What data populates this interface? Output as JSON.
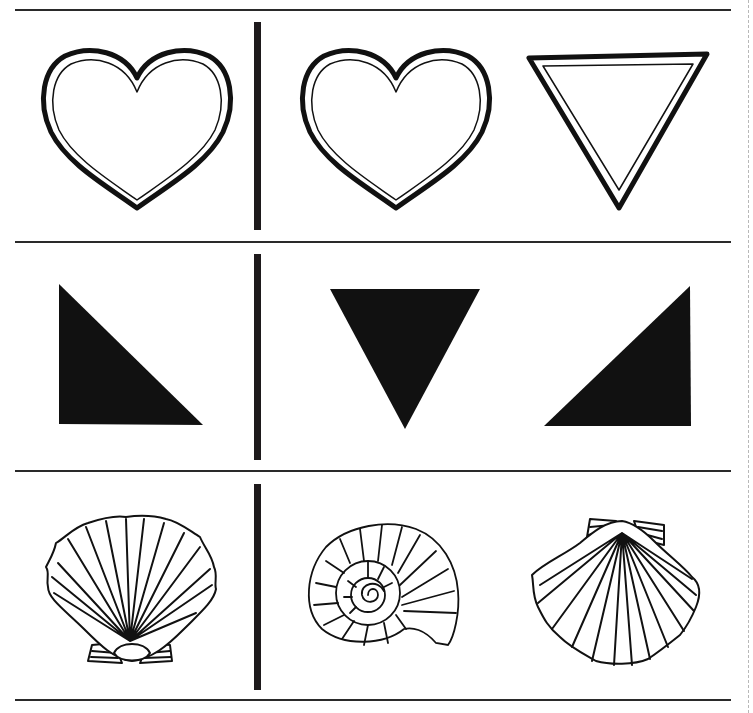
{
  "worksheet": {
    "type": "shape matching exercise",
    "colors": {
      "ink": "#111111",
      "paper": "#ffffff",
      "rule": "#2a2a2a",
      "cut_line": "#b8b8b8"
    },
    "rows": [
      {
        "theme": "hearts and triangles (outlined)",
        "reference": "outlined-heart",
        "choices": [
          "outlined-heart",
          "outlined-inverted-triangle"
        ]
      },
      {
        "theme": "solid triangles",
        "reference": "solid-right-triangle-left",
        "choices": [
          "solid-inverted-triangle",
          "solid-right-triangle-right"
        ]
      },
      {
        "theme": "seashells",
        "reference": "scallop-shell-hinge-down",
        "choices": [
          "spiral-snail-shell",
          "scallop-shell-hinge-up"
        ]
      }
    ]
  }
}
